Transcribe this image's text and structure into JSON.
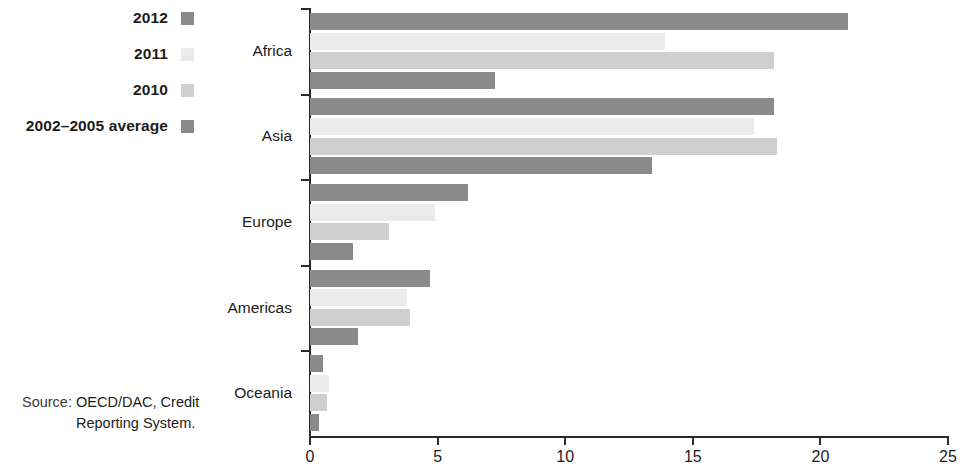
{
  "legend": {
    "items": [
      {
        "label": "2012",
        "color": "#8b8b8b",
        "swatch_icon": "legend-swatch-2012"
      },
      {
        "label": "2011",
        "color": "#ebebeb",
        "swatch_icon": "legend-swatch-2011"
      },
      {
        "label": "2010",
        "color": "#cfcfcf",
        "swatch_icon": "legend-swatch-2010"
      },
      {
        "label": "2002–2005 average",
        "color": "#8a8a8a",
        "swatch_icon": "legend-swatch-average"
      }
    ]
  },
  "source": {
    "prefix": "Source:",
    "text": "OECD/DAC, Credit Reporting System."
  },
  "chart_data": {
    "type": "bar",
    "orientation": "horizontal",
    "title": "",
    "subtitle": "",
    "xlabel": "",
    "ylabel": "",
    "xlim": [
      0,
      25
    ],
    "xticks": [
      0,
      5,
      10,
      15,
      20,
      25
    ],
    "xtick_labels": [
      "0",
      "5",
      "10",
      "15",
      "20",
      "25"
    ],
    "grid": false,
    "legend_position": "top-left-outside",
    "categories": [
      "Africa",
      "Asia",
      "Europe",
      "Americas",
      "Oceania"
    ],
    "series": [
      {
        "name": "2012",
        "color": "#8b8b8b",
        "values": [
          21.1,
          18.2,
          6.2,
          4.7,
          0.5
        ]
      },
      {
        "name": "2011",
        "color": "#ebebeb",
        "values": [
          13.9,
          17.4,
          4.9,
          3.8,
          0.75
        ]
      },
      {
        "name": "2010",
        "color": "#cfcfcf",
        "values": [
          18.2,
          18.3,
          3.1,
          3.9,
          0.65
        ]
      },
      {
        "name": "2002–2005 average",
        "color": "#8a8a8a",
        "values": [
          7.25,
          13.4,
          1.7,
          1.9,
          0.35
        ]
      }
    ]
  }
}
